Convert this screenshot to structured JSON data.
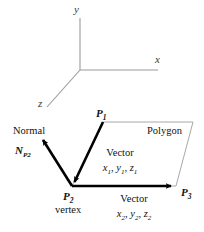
{
  "figure": {
    "background_color": "#ffffff",
    "axis_color": "#9a9a9a",
    "polygon_outline_color": "#a8a8a8",
    "arrow_color": "#000000",
    "text_color": "#111111"
  },
  "axes": {
    "x_label": "x",
    "y_label": "y",
    "z_label": "z",
    "origin": {
      "x": 80,
      "y": 70
    },
    "x_end": {
      "x": 158,
      "y": 70
    },
    "y_end": {
      "x": 80,
      "y": 18
    },
    "z_end": {
      "x": 47,
      "y": 107
    }
  },
  "polygon": {
    "label": "Polygon",
    "vertices": [
      {
        "name": "P1",
        "x": 103,
        "y": 122
      },
      {
        "name": "top_right",
        "x": 193,
        "y": 122
      },
      {
        "name": "P3",
        "x": 176,
        "y": 186
      },
      {
        "name": "P2",
        "x": 72,
        "y": 186
      }
    ]
  },
  "points": {
    "p1": {
      "base": "P",
      "sub": "1"
    },
    "p2": {
      "base": "P",
      "sub": "2"
    },
    "p3": {
      "base": "P",
      "sub": "3"
    },
    "p2_role": "vertex"
  },
  "normal": {
    "word_label": "Normal",
    "symbol_base": "N",
    "symbol_sub": "P2",
    "from": {
      "x": 72,
      "y": 186
    },
    "to": {
      "x": 40,
      "y": 136
    }
  },
  "vectors": [
    {
      "id": "vector-1",
      "label": "Vector",
      "components": "x1, y1, z1",
      "comp_parts": [
        {
          "base": "x",
          "sub": "1"
        },
        {
          "base": "y",
          "sub": "1"
        },
        {
          "base": "z",
          "sub": "1"
        }
      ],
      "from": {
        "x": 103,
        "y": 122
      },
      "to": {
        "x": 72,
        "y": 186
      }
    },
    {
      "id": "vector-2",
      "label": "Vector",
      "components": "x2, y2, z2",
      "comp_parts": [
        {
          "base": "x",
          "sub": "2"
        },
        {
          "base": "y",
          "sub": "2"
        },
        {
          "base": "z",
          "sub": "2"
        }
      ],
      "from": {
        "x": 72,
        "y": 186
      },
      "to": {
        "x": 176,
        "y": 186
      }
    }
  ]
}
